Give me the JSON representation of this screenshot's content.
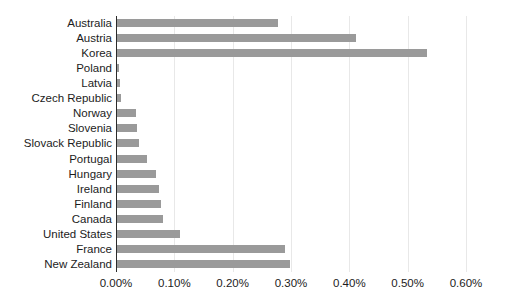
{
  "chart_data": {
    "type": "bar",
    "orientation": "horizontal",
    "title": "",
    "subtitle": "",
    "xlabel": "",
    "ylabel": "",
    "grid": true,
    "legend": null,
    "xlim": [
      0,
      0.6
    ],
    "xtick_labels": [
      "0.00%",
      "0.10%",
      "0.20%",
      "0.30%",
      "0.40%",
      "0.50%",
      "0.60%"
    ],
    "xtick_values": [
      0.0,
      0.1,
      0.2,
      0.3,
      0.4,
      0.5,
      0.6
    ],
    "value_unit": "%",
    "bar_color": "#9a9a9a",
    "axis_color": "#2b2b2b",
    "grid_color": "#e8e8e8",
    "text_color": "#1c1c1c",
    "categories": [
      "Australia",
      "Austria",
      "Korea",
      "Poland",
      "Latvia",
      "Czech Republic",
      "Norway",
      "Slovenia",
      "Slovack Republic",
      "Portugal",
      "Hungary",
      "Ireland",
      "Finland",
      "Canada",
      "United States",
      "France",
      "New Zealand"
    ],
    "values": [
      0.278,
      0.411,
      0.533,
      0.005,
      0.007,
      0.009,
      0.034,
      0.036,
      0.039,
      0.053,
      0.069,
      0.073,
      0.077,
      0.081,
      0.11,
      0.289,
      0.299
    ]
  }
}
